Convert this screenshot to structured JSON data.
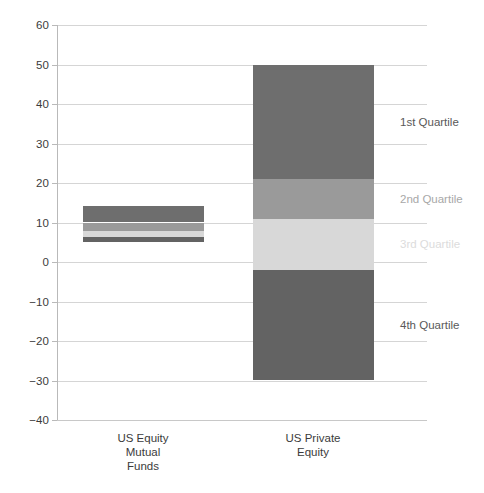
{
  "chart_data": {
    "type": "bar",
    "title": "",
    "subtitle": "",
    "xlabel": "",
    "ylabel": "",
    "ylim": [
      -40,
      60
    ],
    "ytick_step": 10,
    "yticks": [
      60,
      50,
      40,
      30,
      20,
      10,
      0,
      -10,
      -20,
      -30,
      -40
    ],
    "ytick_labels": [
      "60",
      "50",
      "40",
      "30",
      "20",
      "10",
      "0",
      "−10",
      "−20",
      "−30",
      "−40"
    ],
    "grid": true,
    "legend_position": "right",
    "categories": [
      "US Equity\nMutual\nFunds",
      "US Private\nEquity"
    ],
    "series": [
      {
        "name": "1st Quartile",
        "color": "#6e6e6e",
        "segments": [
          {
            "category": "US Equity Mutual Funds",
            "top": 14.2,
            "bottom": 10.0
          },
          {
            "category": "US Private Equity",
            "top": 50.0,
            "bottom": 21.0
          }
        ]
      },
      {
        "name": "2nd Quartile",
        "color": "#9a9a9a",
        "segments": [
          {
            "category": "US Equity Mutual Funds",
            "top": 10.0,
            "bottom": 7.8
          },
          {
            "category": "US Private Equity",
            "top": 21.0,
            "bottom": 11.0
          }
        ]
      },
      {
        "name": "3rd Quartile",
        "color": "#d8d8d8",
        "segments": [
          {
            "category": "US Equity Mutual Funds",
            "top": 7.8,
            "bottom": 6.3
          },
          {
            "category": "US Private Equity",
            "top": 11.0,
            "bottom": -2.0
          }
        ]
      },
      {
        "name": "4th Quartile",
        "color": "#636363",
        "segments": [
          {
            "category": "US Equity Mutual Funds",
            "top": 6.3,
            "bottom": 5.0
          },
          {
            "category": "US Private Equity",
            "top": -2.0,
            "bottom": -30.0
          }
        ]
      }
    ]
  },
  "axis": {
    "ticks": [
      {
        "value": 60,
        "label": "60"
      },
      {
        "value": 50,
        "label": "50"
      },
      {
        "value": 40,
        "label": "40"
      },
      {
        "value": 30,
        "label": "30"
      },
      {
        "value": 20,
        "label": "20"
      },
      {
        "value": 10,
        "label": "10"
      },
      {
        "value": 0,
        "label": "0"
      },
      {
        "value": -10,
        "label": "−10"
      },
      {
        "value": -20,
        "label": "−20"
      },
      {
        "value": -30,
        "label": "−30"
      },
      {
        "value": -40,
        "label": "−40"
      }
    ]
  },
  "categories": [
    {
      "id": "us-equity-mutual-funds",
      "label": "US Equity\nMutual\nFunds"
    },
    {
      "id": "us-private-equity",
      "label": "US Private\nEquity"
    }
  ],
  "legend": {
    "items": [
      {
        "id": "1st-quartile",
        "label": "1st Quartile",
        "color": "#595959",
        "anchor_value": 35.5
      },
      {
        "id": "2nd-quartile",
        "label": "2nd Quartile",
        "color": "#a8a8a8",
        "anchor_value": 16.0
      },
      {
        "id": "3rd-quartile",
        "label": "3rd Quartile",
        "color": "#dcdcdc",
        "anchor_value": 4.5
      },
      {
        "id": "4th-quartile",
        "label": "4th Quartile",
        "color": "#595959",
        "anchor_value": -16.0
      }
    ]
  },
  "colors": {
    "background": "#ffffff",
    "gridline": "#d5d5d5",
    "axis_line": "#b9b9b9",
    "text": "#3b3b3b",
    "quartile_1": "#6e6e6e",
    "quartile_2": "#9a9a9a",
    "quartile_3": "#d8d8d8",
    "quartile_4": "#636363"
  }
}
